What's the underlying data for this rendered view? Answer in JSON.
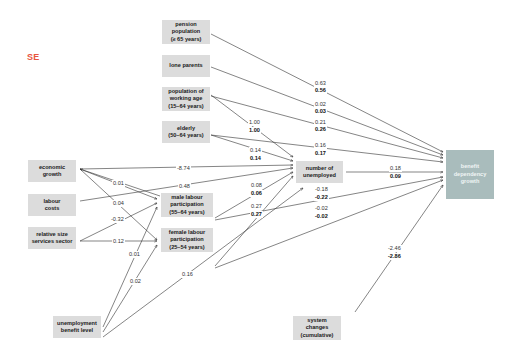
{
  "title": "SE",
  "colors": {
    "title": "#e8553e",
    "node": "#dcdcdc",
    "outcome": "#a9bcbc",
    "line": "#333333"
  },
  "nodes": {
    "pension": "pension\npopulation\n(≥ 65 years)",
    "lone_parents": "lone parents",
    "working_age": "population of\nworking age\n(15–64 years)",
    "elderly": "elderly\n(50–64 years)",
    "economic_growth": "economic\ngrowth",
    "labour_costs": "labour\ncosts",
    "services": "relative size\nservices sector",
    "male_part": "male labour\nparticipation\n(55–64 years)",
    "female_part": "female labour\nparticipation\n(25–54 years)",
    "unemployed": "number of\nunemployed",
    "benefit_growth": "benefit\ndependency\ngrowth",
    "benefit_level": "unemployment\nbenefit level",
    "system_changes": "system\nchanges\n(cumulative)"
  },
  "edges": {
    "pension_out": [
      "0.63",
      "0.56"
    ],
    "lone_out": [
      "0.02",
      "0.03"
    ],
    "working_out": [
      "0.21",
      "0.26"
    ],
    "working_unemp": [
      "1.00",
      "1.00"
    ],
    "elderly_out": [
      "0.16",
      "0.17"
    ],
    "elderly_unemp": [
      "0.14",
      "0.14"
    ],
    "growth_unemp": "-8.74",
    "growth_male": "0.01",
    "growth_female": "0.04",
    "labour_unemp": "0.48",
    "services_male": "-0.32",
    "services_female": "0.12",
    "male_unemp": [
      "0.08",
      "0.06"
    ],
    "male_out": [
      "-0.18",
      "-0.22"
    ],
    "female_unemp": [
      "0.27",
      "0.27"
    ],
    "female_out": [
      "-0.02",
      "-0.02"
    ],
    "unemp_out": [
      "0.18",
      "0.09"
    ],
    "benefit_male": "0.01",
    "benefit_female": "0.02",
    "benefit_unemp": "0.16",
    "system_out": [
      "-2.46",
      "-2.86"
    ]
  }
}
